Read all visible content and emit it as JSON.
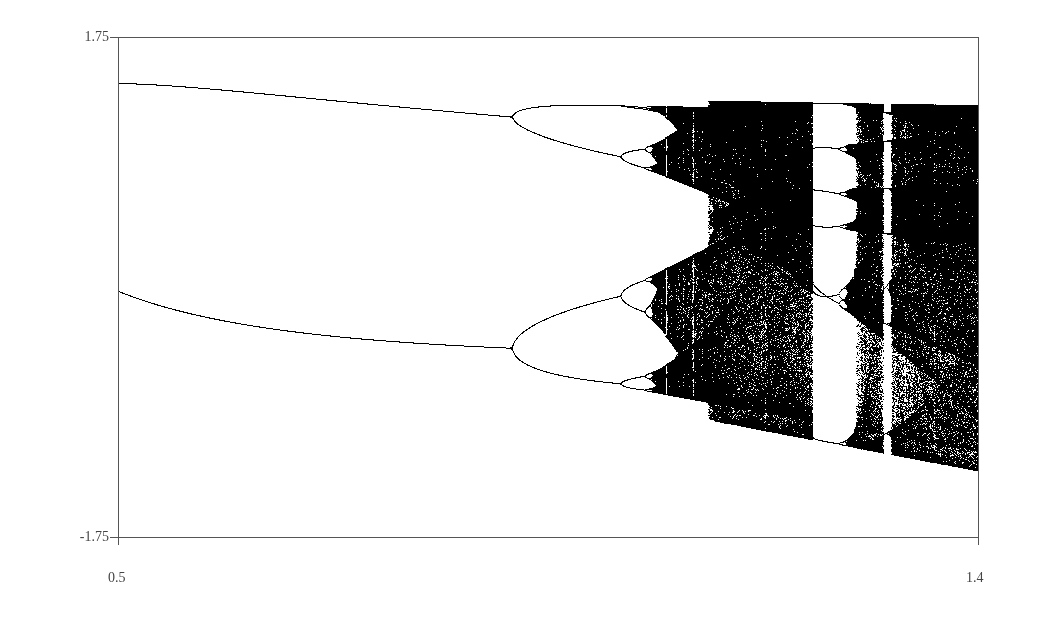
{
  "chart_data": {
    "type": "scatter",
    "title": "",
    "subtitle": "",
    "xlabel": "",
    "ylabel": "",
    "xlim": [
      0.5,
      1.4
    ],
    "ylim": [
      -1.75,
      1.75
    ],
    "x_ticks": [
      "0.5",
      "1.4"
    ],
    "y_ticks": [
      "1.75",
      "-1.75"
    ],
    "grid": false,
    "legend": null,
    "map": {
      "name": "Henon",
      "b": 0.3,
      "a_min": 0.5,
      "a_max": 1.4
    },
    "features": [
      {
        "label": "period-2 branches at a=0.5",
        "x": 0.5,
        "y": [
          0.73,
          -0.75
        ]
      },
      {
        "label": "period-4 bifurcation",
        "a": 0.912
      },
      {
        "label": "period-8 bifurcation",
        "a": 1.026
      },
      {
        "label": "onset of chaos",
        "a": 1.06
      },
      {
        "label": "period-7 window",
        "a": 1.22
      },
      {
        "label": "period-6 window",
        "a": 1.295
      }
    ],
    "point_color": "#000000"
  },
  "axes": {
    "y_top_label": "1.75",
    "y_bottom_label": "-1.75",
    "x_left_label": "0.5",
    "x_right_label": "1.4"
  },
  "layout": {
    "plot_left": 118,
    "plot_right": 978,
    "plot_top": 37,
    "plot_bottom": 537,
    "axis_color": "#555555"
  }
}
